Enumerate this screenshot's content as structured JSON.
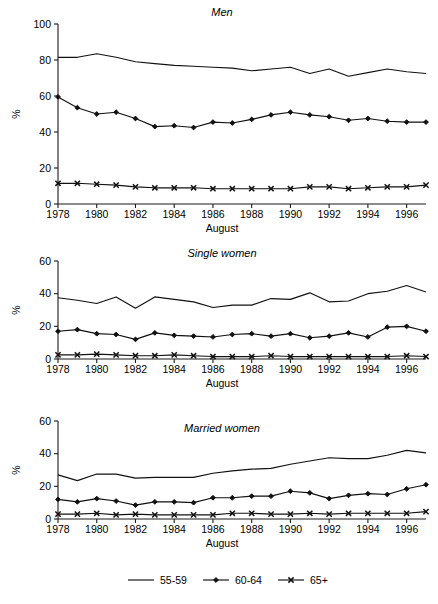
{
  "figure": {
    "percent_axis_label": "%",
    "x_axis_label": "August"
  },
  "legend": {
    "items": [
      {
        "label": "55-59",
        "marker": "none"
      },
      {
        "label": "60-64",
        "marker": "diamond"
      },
      {
        "label": "65+",
        "marker": "cross-x"
      }
    ]
  },
  "chart_data": [
    {
      "type": "line",
      "title": "Men",
      "xlabel": "August",
      "ylabel": "%",
      "ylim": [
        0,
        100
      ],
      "yticks": [
        0,
        20,
        40,
        60,
        80,
        100
      ],
      "xlim": [
        1978,
        1997
      ],
      "xticks": [
        1978,
        1980,
        1982,
        1984,
        1986,
        1988,
        1990,
        1992,
        1994,
        1996
      ],
      "grid": false,
      "legend_position": "below-figure",
      "x": [
        1978,
        1979,
        1980,
        1981,
        1982,
        1983,
        1984,
        1985,
        1986,
        1987,
        1988,
        1989,
        1990,
        1991,
        1992,
        1993,
        1994,
        1995,
        1996,
        1997
      ],
      "series": [
        {
          "name": "55-59",
          "marker": "none",
          "values": [
            81.5,
            81.5,
            83.5,
            81.5,
            79.0,
            78.0,
            77.0,
            76.5,
            76.0,
            75.5,
            74.0,
            75.0,
            76.0,
            72.5,
            75.0,
            71.0,
            73.0,
            75.0,
            73.5,
            72.5
          ]
        },
        {
          "name": "60-64",
          "marker": "diamond",
          "values": [
            59.5,
            53.5,
            50.0,
            51.0,
            47.5,
            43.0,
            43.5,
            42.5,
            45.5,
            45.0,
            47.0,
            49.5,
            51.0,
            49.5,
            48.5,
            46.5,
            47.5,
            46.0,
            45.5,
            45.5
          ]
        },
        {
          "name": "65+",
          "marker": "cross-x",
          "values": [
            11.5,
            11.5,
            11.0,
            10.5,
            9.5,
            9.0,
            9.0,
            9.0,
            8.5,
            8.5,
            8.5,
            8.5,
            8.5,
            9.5,
            9.5,
            8.5,
            9.0,
            9.5,
            9.5,
            10.5
          ]
        }
      ]
    },
    {
      "type": "line",
      "title": "Single women",
      "xlabel": "August",
      "ylabel": "%",
      "ylim": [
        0,
        60
      ],
      "yticks": [
        0,
        20,
        40,
        60
      ],
      "xlim": [
        1978,
        1997
      ],
      "xticks": [
        1978,
        1980,
        1982,
        1984,
        1986,
        1988,
        1990,
        1992,
        1994,
        1996
      ],
      "grid": false,
      "legend_position": "below-figure",
      "x": [
        1978,
        1979,
        1980,
        1981,
        1982,
        1983,
        1984,
        1985,
        1986,
        1987,
        1988,
        1989,
        1990,
        1991,
        1992,
        1993,
        1994,
        1995,
        1996,
        1997
      ],
      "series": [
        {
          "name": "55-59",
          "marker": "none",
          "values": [
            37.5,
            36.0,
            34.0,
            38.0,
            31.0,
            38.0,
            36.5,
            35.0,
            31.5,
            33.0,
            33.0,
            37.0,
            36.5,
            40.5,
            35.0,
            35.5,
            40.0,
            41.5,
            45.0,
            41.0
          ]
        },
        {
          "name": "60-64",
          "marker": "diamond",
          "values": [
            17.0,
            18.0,
            15.5,
            15.0,
            12.0,
            16.0,
            14.5,
            14.0,
            13.5,
            15.0,
            15.5,
            14.0,
            15.5,
            13.0,
            14.0,
            16.0,
            13.5,
            19.5,
            20.0,
            17.0
          ]
        },
        {
          "name": "65+",
          "marker": "cross-x",
          "values": [
            2.5,
            2.5,
            3.0,
            2.5,
            2.0,
            2.0,
            2.5,
            2.0,
            1.5,
            1.5,
            1.5,
            2.0,
            1.5,
            1.5,
            1.5,
            1.5,
            1.5,
            1.5,
            2.0,
            1.5
          ]
        }
      ]
    },
    {
      "type": "line",
      "title": "Married women",
      "xlabel": "August",
      "ylabel": "%",
      "ylim": [
        0,
        60
      ],
      "yticks": [
        0,
        20,
        40,
        60
      ],
      "xlim": [
        1978,
        1997
      ],
      "xticks": [
        1978,
        1980,
        1982,
        1984,
        1986,
        1988,
        1990,
        1992,
        1994,
        1996
      ],
      "grid": false,
      "legend_position": "below-figure",
      "x": [
        1978,
        1979,
        1980,
        1981,
        1982,
        1983,
        1984,
        1985,
        1986,
        1987,
        1988,
        1989,
        1990,
        1991,
        1992,
        1993,
        1994,
        1995,
        1996,
        1997
      ],
      "series": [
        {
          "name": "55-59",
          "marker": "none",
          "values": [
            27.0,
            23.5,
            27.5,
            27.5,
            25.0,
            25.5,
            25.5,
            25.5,
            28.0,
            29.5,
            30.5,
            31.0,
            33.5,
            35.5,
            37.5,
            37.0,
            37.0,
            39.0,
            42.0,
            40.5
          ]
        },
        {
          "name": "60-64",
          "marker": "diamond",
          "values": [
            12.0,
            10.5,
            12.5,
            11.0,
            8.5,
            10.5,
            10.5,
            10.0,
            13.0,
            13.0,
            14.0,
            14.0,
            17.0,
            16.0,
            12.5,
            14.5,
            15.5,
            15.0,
            18.5,
            21.0
          ]
        },
        {
          "name": "65+",
          "marker": "cross-x",
          "values": [
            3.0,
            3.0,
            3.5,
            2.5,
            3.0,
            2.5,
            2.5,
            2.5,
            2.5,
            3.5,
            3.5,
            3.0,
            3.0,
            3.5,
            3.0,
            3.5,
            3.5,
            3.5,
            3.5,
            4.5
          ]
        }
      ]
    }
  ]
}
